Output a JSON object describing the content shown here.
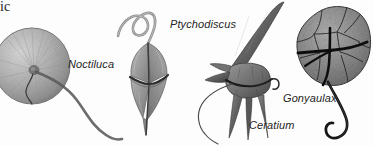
{
  "figure": {
    "kind": "scientific-illustration",
    "background_color": "#fdfdfd",
    "width": 373,
    "height": 146,
    "cropped_caption_fragment": "ic"
  },
  "labels": {
    "noctiluca": "Noctiluca",
    "ptychodiscus": "Ptychodiscus",
    "ceratium": "Ceratium",
    "gonyaulax": "Gonyaulax"
  },
  "organisms": [
    {
      "id": "noctiluca",
      "label": "Noctiluca",
      "shape": "sphere",
      "body_color": "#a8a8a8",
      "detail_color": "#6e6e6e",
      "flagellum": "long-trailing-curve",
      "cropped_at_left_edge": true
    },
    {
      "id": "ptychodiscus",
      "label": "Ptychodiscus",
      "shape": "rhomboid-biconical",
      "body_color": "#9a9a9a",
      "detail_color": "#4a4a4a",
      "flagellum": "apical-hook-curve",
      "cropped_at_left_edge": false
    },
    {
      "id": "ceratium",
      "label": "Ceratium",
      "shape": "horned-triangular",
      "body_color": "#6b6b6b",
      "detail_color": "#2e2e2e",
      "flagellum": "thin-trailing-curve",
      "cropped_at_left_edge": false
    },
    {
      "id": "gonyaulax",
      "label": "Gonyaulax",
      "shape": "armored-polygonal",
      "body_color": "#8d8d8d",
      "detail_color": "#1c1c1c",
      "flagellum": "trailing-s-curve",
      "cropped_at_left_edge": false
    }
  ],
  "colors": {
    "text": "#262626",
    "caption_fragment_text": "#1d1d1d",
    "background": "#fdfdfd"
  }
}
